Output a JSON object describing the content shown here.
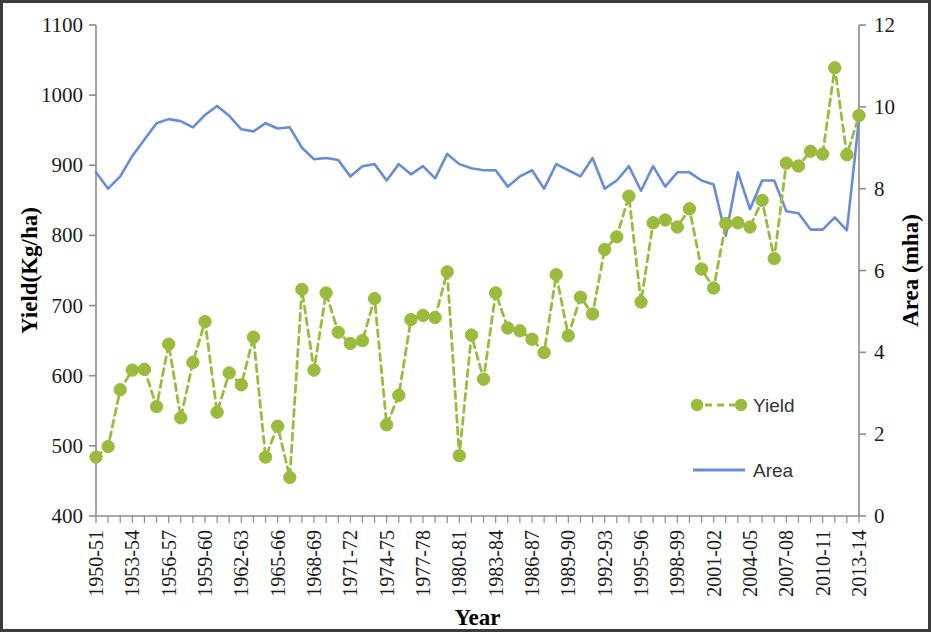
{
  "chart_data": {
    "type": "line",
    "title": "",
    "xlabel": "Year",
    "ylabel": "Yield(Kg/ha)",
    "y2label": "Area (mha)",
    "ylim": [
      400,
      1100
    ],
    "y2lim": [
      0,
      12
    ],
    "ytick_labels": [
      "1100",
      "1000",
      "900",
      "800",
      "700",
      "600",
      "500",
      "400"
    ],
    "ytick_values": [
      1100,
      1000,
      900,
      800,
      700,
      600,
      500,
      400
    ],
    "y2tick_labels": [
      "12",
      "10",
      "8",
      "6",
      "4",
      "2",
      "0"
    ],
    "y2tick_values": [
      12,
      10,
      8,
      6,
      4,
      2,
      0
    ],
    "grid": false,
    "legend_position": "inside-right",
    "xtick_labels": [
      "1950-51",
      "1953-54",
      "1956-57",
      "1959-60",
      "1962-63",
      "1965-66",
      "1968-69",
      "1971-72",
      "1974-75",
      "1977-78",
      "1980-81",
      "1983-84",
      "1986-87",
      "1989-90",
      "1992-93",
      "1995-96",
      "1998-99",
      "2001-02",
      "2004-05",
      "2007-08",
      "2010-11",
      "2013-14"
    ],
    "x": [
      "1950-51",
      "1951-52",
      "1952-53",
      "1953-54",
      "1954-55",
      "1955-56",
      "1956-57",
      "1957-58",
      "1958-59",
      "1959-60",
      "1960-61",
      "1961-62",
      "1962-63",
      "1963-64",
      "1964-65",
      "1965-66",
      "1966-67",
      "1967-68",
      "1968-69",
      "1969-70",
      "1970-71",
      "1971-72",
      "1972-73",
      "1973-74",
      "1974-75",
      "1975-76",
      "1976-77",
      "1977-78",
      "1978-79",
      "1979-80",
      "1980-81",
      "1981-82",
      "1982-83",
      "1983-84",
      "1984-85",
      "1985-86",
      "1986-87",
      "1987-88",
      "1988-89",
      "1989-90",
      "1990-91",
      "1991-92",
      "1992-93",
      "1993-94",
      "1994-95",
      "1995-96",
      "1996-97",
      "1997-98",
      "1998-99",
      "1999-00",
      "2000-01",
      "2001-02",
      "2002-03",
      "2003-04",
      "2004-05",
      "2005-06",
      "2006-07",
      "2007-08",
      "2008-09",
      "2009-10",
      "2010-11",
      "2011-12",
      "2012-13",
      "2013-14"
    ],
    "series": [
      {
        "name": "Yield",
        "axis": "left",
        "unit": "Kg/ha",
        "color": "#9BBB3C",
        "style": "dashed-markers",
        "values": [
          484,
          499,
          580,
          608,
          609,
          556,
          645,
          540,
          619,
          677,
          548,
          604,
          587,
          655,
          484,
          528,
          455,
          723,
          608,
          718,
          662,
          646,
          650,
          710,
          530,
          572,
          680,
          686,
          683,
          748,
          486,
          658,
          595,
          718,
          668,
          664,
          652,
          633,
          744,
          657,
          712,
          688,
          780,
          798,
          856,
          705,
          818,
          822,
          812,
          838,
          752,
          725,
          817,
          818,
          812,
          850,
          767,
          903,
          899,
          920,
          916,
          1039,
          915,
          971
        ]
      },
      {
        "name": "Area",
        "axis": "right",
        "unit": "mha",
        "color": "#6A8CD4",
        "style": "solid",
        "values": [
          8.4,
          8.0,
          8.3,
          8.8,
          9.2,
          9.6,
          9.7,
          9.65,
          9.5,
          9.8,
          10.02,
          9.78,
          9.45,
          9.4,
          9.6,
          9.47,
          9.5,
          9.0,
          8.72,
          8.75,
          8.7,
          8.3,
          8.55,
          8.6,
          8.2,
          8.6,
          8.35,
          8.55,
          8.25,
          8.85,
          8.6,
          8.5,
          8.45,
          8.45,
          8.05,
          8.3,
          8.45,
          8.0,
          8.6,
          8.45,
          8.3,
          8.75,
          8.0,
          8.2,
          8.55,
          7.95,
          8.55,
          8.05,
          8.4,
          8.4,
          8.2,
          8.1,
          6.85,
          8.4,
          7.5,
          8.2,
          8.2,
          7.45,
          7.4,
          7.0,
          7.0,
          7.3,
          6.98,
          9.7
        ]
      }
    ]
  },
  "legend": {
    "items": [
      {
        "label": "Yield",
        "marker": "circle-dashed",
        "color": "#9BBB3C"
      },
      {
        "label": "Area",
        "marker": "line",
        "color": "#6A8CD4"
      }
    ]
  }
}
